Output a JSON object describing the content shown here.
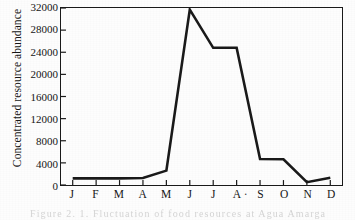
{
  "chart_data": {
    "type": "line",
    "title": "",
    "xlabel": "",
    "ylabel": "Concentrated resource abundance",
    "categories": [
      "J",
      "F",
      "M",
      "A",
      "M",
      "J",
      "J",
      "A",
      "S",
      "O",
      "N",
      "D"
    ],
    "category_names": [
      "January",
      "February",
      "March",
      "April",
      "May",
      "June",
      "July",
      "August",
      "September",
      "October",
      "November",
      "December"
    ],
    "values": [
      1200,
      1200,
      1200,
      1250,
      2600,
      31700,
      24800,
      24800,
      4700,
      4650,
      500,
      1300
    ],
    "ylim": [
      0,
      32000
    ],
    "ytick_values": [
      0,
      4000,
      8000,
      12000,
      16000,
      20000,
      24000,
      28000,
      32000
    ],
    "ytick_labels": [
      "0",
      "4000",
      "8000",
      "12000",
      "16000",
      "20000",
      "24000",
      "28000",
      "32000"
    ],
    "grid": false,
    "legend": null,
    "legend_position": "none",
    "line_color": "#1a1a1a",
    "line_width": 2.6,
    "frame": true,
    "markers": false
  },
  "axis": {
    "y_title": "Concentrated resource abundance",
    "x_tick_artifact": "·"
  },
  "caption": {
    "text": "Figure 2. 1. Fluctuation of food resources at Agua Amarga"
  },
  "colors": {
    "ink": "#1a1a1a",
    "paper": "#fdfdfd",
    "line": "#1a1a1a"
  }
}
